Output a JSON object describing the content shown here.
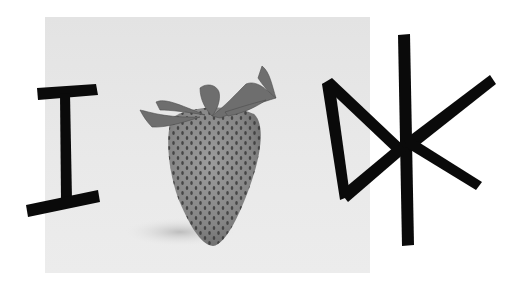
{
  "image": {
    "description": "Grayscale photo of a strawberry with hand-drawn black marker letters forming a visual pun",
    "caption_text": "I ♥ DK",
    "reading": "IDK",
    "left_glyph": "I",
    "center_object": "strawberry (as heart)",
    "right_glyph": "DK",
    "colors": {
      "page_background": "#ffffff",
      "photo_background": "#e6e6e6",
      "ink": "#0a0a0a",
      "strawberry_body": "#8a8a8a",
      "strawberry_seeds": "#3a3a3a",
      "leaves": "#6e6e6e"
    }
  }
}
